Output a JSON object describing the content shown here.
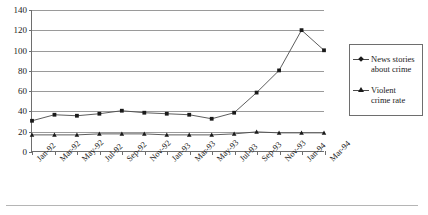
{
  "chart_data": {
    "type": "line",
    "title": "",
    "subtitle": "",
    "xlabel": "",
    "ylabel": "",
    "ylim": [
      0,
      140
    ],
    "ytick_step": 20,
    "yticks": [
      "0",
      "20",
      "40",
      "60",
      "80",
      "100",
      "120",
      "140"
    ],
    "grid": true,
    "legend_position": "right",
    "categories": [
      "Jan-92",
      "Mar-92",
      "May-92",
      "Jul-92",
      "Sep-92",
      "Nov-92",
      "Jan-93",
      "Mar-93",
      "May-93",
      "Jul-93",
      "Sep-93",
      "Nov-93",
      "Jan-94",
      "Mar-94"
    ],
    "series": [
      {
        "name": "News stories about crime",
        "marker": "diamond",
        "color": "#1a1a1a",
        "values": [
          30,
          36,
          35,
          37,
          40,
          38,
          37,
          36,
          32,
          38,
          58,
          80,
          120,
          100
        ]
      },
      {
        "name": "Violent crime rate",
        "marker": "triangle",
        "color": "#1a1a1a",
        "values": [
          16,
          16,
          16,
          17,
          17,
          17,
          16,
          16,
          16,
          17,
          19,
          18,
          18,
          18
        ]
      }
    ]
  },
  "legend": {
    "entries": [
      {
        "label_line1": "News stories",
        "label_line2": "about crime",
        "marker": "diamond"
      },
      {
        "label_line1": "Violent",
        "label_line2": "crime rate",
        "marker": "triangle"
      }
    ]
  },
  "colors": {
    "axis": "#6e6e6e",
    "gridline": "#9a9a9a",
    "series_line": "#4a4a4a",
    "marker": "#1a1a1a",
    "background": "#ffffff"
  }
}
